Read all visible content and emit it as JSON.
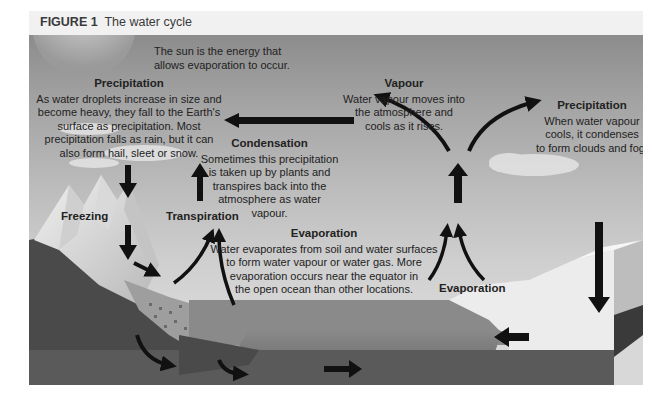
{
  "figure": {
    "label": "FIGURE 1",
    "title": "The water cycle"
  },
  "annotations": {
    "sun": {
      "text": "The sun is the energy that allows evaporation to occur.",
      "line1": "The sun is the energy that",
      "line2": "allows evaporation to occur."
    },
    "precipitation_left": {
      "title": "Precipitation",
      "lines": [
        "As water droplets increase in size and",
        "become heavy, they fall to the Earth's",
        "surface as precipitation. Most",
        "precipitation falls as rain, but it can",
        "also form hail, sleet or snow."
      ]
    },
    "vapour": {
      "title": "Vapour",
      "lines": [
        "Water vapour moves into",
        "the atmosphere and",
        "cools as it rises."
      ]
    },
    "precipitation_right": {
      "title": "Precipitation",
      "lines": [
        "When water vapour",
        "cools, it condenses",
        "to form clouds and fog."
      ]
    },
    "condensation": {
      "title": "Condensation",
      "lines": [
        "Sometimes this precipitation",
        "is taken up by plants and",
        "transpires back into the",
        "atmosphere as water",
        "vapour."
      ]
    },
    "evaporation_center": {
      "title": "Evaporation",
      "lines": [
        "Water evaporates from soil and water surfaces",
        "to form water vapour or water gas. More",
        "evaporation occurs near the equator in",
        "the open ocean than other locations."
      ]
    },
    "freezing": "Freezing",
    "transpiration": "Transpiration",
    "evaporation_right": "Evaporation"
  },
  "colors": {
    "sky_top": "#8c8c8c",
    "sky_bottom": "#d8d8d8",
    "arrow": "#111111",
    "ground_dark": "#4a4a4a",
    "ocean": "#7a7a7a",
    "ice": "#eeeeee",
    "caption_bar": "#f1f1f1"
  }
}
